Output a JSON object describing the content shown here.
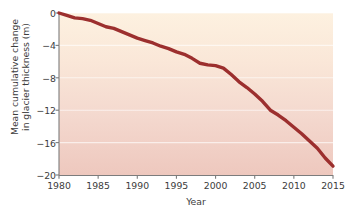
{
  "chart_data": {
    "type": "line",
    "title": "",
    "xlabel": "Year",
    "ylabel": "Mean cumulative change\nin glacier thickness (m)",
    "ylabel_line1": "Mean cumulative change",
    "ylabel_line2": "in glacier thickness (m)",
    "xlim": [
      1980,
      2015
    ],
    "ylim": [
      -20,
      0
    ],
    "xticks": [
      1980,
      1985,
      1990,
      1995,
      2000,
      2005,
      2010,
      2015
    ],
    "xtick_labels": [
      "1980",
      "1985",
      "1990",
      "1995",
      "2000",
      "2005",
      "2010",
      "2015"
    ],
    "yticks": [
      0,
      -4,
      -8,
      -12,
      -16,
      -20
    ],
    "ytick_labels": [
      "0",
      "−4",
      "−8",
      "−12",
      "−16",
      "−20"
    ],
    "grid": "horizontal-light",
    "legend": "none",
    "line_color": "#9c2f2e",
    "line_width": 3.4,
    "background_top_color": "#fdf1e0",
    "background_mid_color": "#f6dcd1",
    "background_bottom_color": "#eec8be",
    "axis_color": "#7c7c7c",
    "text_color": "#3c3c3c",
    "x": [
      1980,
      1981,
      1982,
      1983,
      1984,
      1985,
      1986,
      1987,
      1988,
      1989,
      1990,
      1991,
      1992,
      1993,
      1994,
      1995,
      1996,
      1997,
      1998,
      1999,
      2000,
      2001,
      2002,
      2003,
      2004,
      2005,
      2006,
      2007,
      2008,
      2009,
      2010,
      2011,
      2012,
      2013,
      2014,
      2015
    ],
    "values": [
      0.0,
      -0.3,
      -0.6,
      -0.7,
      -0.9,
      -1.3,
      -1.7,
      -1.9,
      -2.3,
      -2.7,
      -3.1,
      -3.4,
      -3.7,
      -4.1,
      -4.4,
      -4.8,
      -5.1,
      -5.6,
      -6.2,
      -6.4,
      -6.5,
      -6.8,
      -7.6,
      -8.5,
      -9.2,
      -10.0,
      -10.9,
      -12.0,
      -12.6,
      -13.3,
      -14.1,
      -14.9,
      -15.8,
      -16.7,
      -17.9,
      -18.9
    ],
    "series_name": "Mean cumulative change in glacier thickness"
  }
}
